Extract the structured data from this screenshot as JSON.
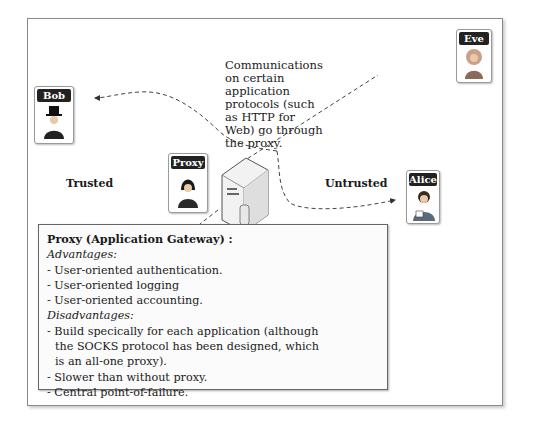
{
  "actors": {
    "bob": {
      "label": "Bob",
      "icon": "top-hat-man-icon"
    },
    "proxy": {
      "label": "Proxy",
      "icon": "hooded-person-icon"
    },
    "alice": {
      "label": "Alice",
      "icon": "woman-with-book-icon"
    },
    "eve": {
      "label": "Eve",
      "icon": "curly-hair-woman-icon"
    }
  },
  "zones": {
    "trusted": "Trusted",
    "untrusted": "Untrusted"
  },
  "note": "Communications on certain application protocols (such as HTTP for Web) go through the proxy.",
  "info": {
    "title": "Proxy (Application Gateway) :",
    "advantages_label": "Advantages:",
    "advantages": [
      "- User-oriented authentication.",
      "- User-oriented logging",
      "- User-oriented accounting."
    ],
    "disadvantages_label": "Disadvantages:",
    "disadvantages": [
      "- Build specically for each application (although",
      "the SOCKS protocol has been designed, which",
      "is an all-one proxy).",
      "- Slower than without proxy.",
      "- Central point-of-failure."
    ]
  }
}
